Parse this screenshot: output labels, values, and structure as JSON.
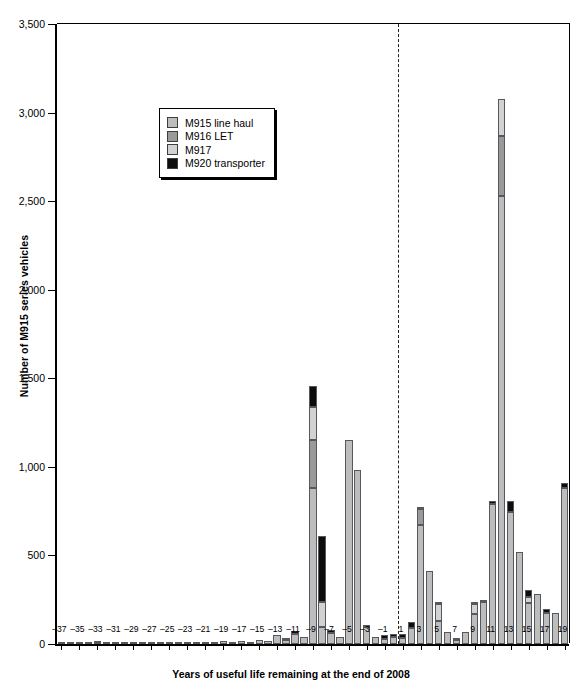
{
  "chart_data": {
    "type": "bar",
    "stacked": true,
    "title": "",
    "xlabel": "Years of useful life remaining at the end of 2008",
    "ylabel": "Number of M915 series vehicles",
    "ylim": [
      0,
      3500
    ],
    "ytick_values": [
      0,
      500,
      1000,
      1500,
      2000,
      2500,
      3000,
      3500
    ],
    "ytick_labels": [
      "0",
      "500",
      "1,000",
      "1,500",
      "2,000",
      "2,500",
      "3,000",
      "3,500"
    ],
    "grid": false,
    "legend_position": "upper-left-inside",
    "annotations": [
      {
        "type": "vline",
        "x": 0.5,
        "style": "dashed",
        "label": ""
      }
    ],
    "x": [
      -37,
      -36,
      -35,
      -34,
      -33,
      -32,
      -31,
      -30,
      -29,
      -28,
      -27,
      -26,
      -25,
      -24,
      -23,
      -22,
      -21,
      -20,
      -19,
      -18,
      -17,
      -16,
      -15,
      -14,
      -13,
      -12,
      -11,
      -10,
      -9,
      -8,
      -7,
      -6,
      -5,
      -4,
      -3,
      -2,
      -1,
      0,
      1,
      2,
      3,
      4,
      5,
      6,
      7,
      8,
      9,
      10,
      11,
      12,
      13,
      14,
      15,
      16,
      17,
      18,
      19
    ],
    "xtick_labels": [
      "-37",
      "-35",
      "-33",
      "-31",
      "-29",
      "-27",
      "-25",
      "-23",
      "-21",
      "-19",
      "-17",
      "-15",
      "-13",
      "-11",
      "-9",
      "-7",
      "-5",
      "-3",
      "-1",
      "1",
      "3",
      "5",
      "7",
      "9",
      "11",
      "13",
      "15",
      "17",
      "19"
    ],
    "series": [
      {
        "name": "M915 line haul",
        "color": "#bdbdbd",
        "values": [
          6,
          3,
          4,
          5,
          6,
          4,
          5,
          4,
          6,
          5,
          6,
          5,
          6,
          5,
          8,
          6,
          14,
          10,
          18,
          12,
          16,
          10,
          22,
          16,
          50,
          24,
          58,
          40,
          880,
          95,
          60,
          40,
          1150,
          980,
          95,
          40,
          28,
          40,
          35,
          90,
          670,
          410,
          130,
          70,
          25,
          70,
          170,
          235,
          790,
          2530,
          745,
          520,
          230,
          285,
          175,
          175,
          880
        ]
      },
      {
        "name": "M916 LET",
        "color": "#9a9a9a",
        "values": [
          0,
          0,
          0,
          0,
          0,
          0,
          0,
          0,
          0,
          0,
          0,
          0,
          0,
          0,
          0,
          0,
          0,
          0,
          0,
          0,
          0,
          0,
          0,
          0,
          0,
          0,
          0,
          0,
          270,
          0,
          0,
          0,
          0,
          0,
          0,
          0,
          0,
          0,
          0,
          0,
          95,
          0,
          0,
          0,
          0,
          0,
          0,
          0,
          0,
          340,
          0,
          0,
          0,
          0,
          0,
          0,
          0
        ]
      },
      {
        "name": "M917",
        "color": "#d2d2d2",
        "values": [
          0,
          0,
          0,
          0,
          0,
          0,
          0,
          0,
          0,
          0,
          0,
          0,
          0,
          0,
          0,
          0,
          0,
          0,
          0,
          0,
          0,
          0,
          0,
          0,
          0,
          0,
          0,
          0,
          190,
          140,
          0,
          0,
          0,
          0,
          0,
          0,
          0,
          0,
          0,
          0,
          0,
          0,
          95,
          0,
          0,
          0,
          55,
          0,
          0,
          205,
          0,
          0,
          35,
          0,
          0,
          0,
          0
        ]
      },
      {
        "name": "M920 transporter",
        "color": "#0d0d0d",
        "values": [
          0,
          0,
          0,
          0,
          4,
          0,
          0,
          0,
          0,
          0,
          0,
          0,
          0,
          0,
          0,
          0,
          0,
          0,
          0,
          0,
          0,
          0,
          0,
          0,
          0,
          10,
          18,
          0,
          115,
          375,
          18,
          0,
          0,
          0,
          10,
          0,
          22,
          18,
          20,
          35,
          10,
          0,
          10,
          0,
          5,
          0,
          10,
          10,
          20,
          0,
          60,
          0,
          40,
          0,
          25,
          0,
          30
        ]
      }
    ]
  },
  "legend": {
    "items": [
      {
        "label": "M915 line haul",
        "color": "#bdbdbd"
      },
      {
        "label": "M916 LET",
        "color": "#9a9a9a"
      },
      {
        "label": "M917",
        "color": "#d2d2d2"
      },
      {
        "label": "M920 transporter",
        "color": "#0d0d0d"
      }
    ]
  }
}
